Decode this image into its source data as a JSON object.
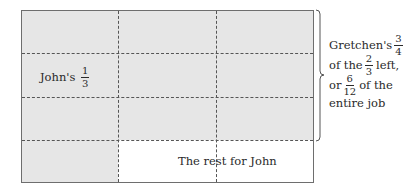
{
  "diagram": {
    "grid": {
      "rows": 4,
      "cols": 3,
      "shaded_color": "#e6e6e6",
      "unshaded_color": "#ffffff",
      "border_color": "#6e6e6e"
    },
    "johns_label": {
      "text": "John's",
      "fraction": {
        "numerator": "1",
        "denominator": "3"
      }
    },
    "rest_label": "The rest for John",
    "brace_annotation": {
      "line1": {
        "text": "Gretchen's",
        "fraction": {
          "numerator": "3",
          "denominator": "4"
        }
      },
      "line2": {
        "prefix": "of the",
        "fraction": {
          "numerator": "2",
          "denominator": "3"
        },
        "suffix": "left,"
      },
      "line3": {
        "prefix": "or",
        "fraction": {
          "numerator": "6",
          "denominator": "12"
        },
        "suffix": "of the"
      },
      "line4": {
        "text": "entire job"
      }
    }
  }
}
